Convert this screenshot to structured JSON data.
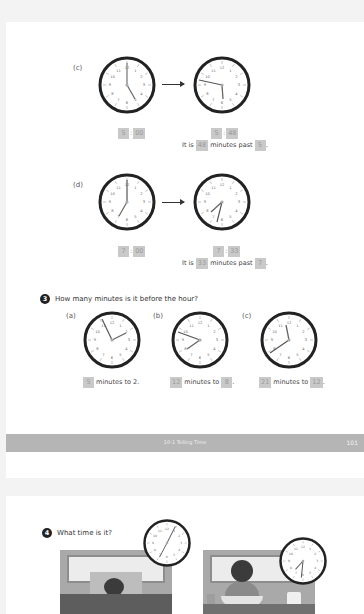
{
  "page1": {
    "part_c": {
      "label": "(c)",
      "start_time": {
        "hour": "5",
        "minute": "00"
      },
      "end_time": {
        "hour": "5",
        "minute": "48"
      },
      "sentence": {
        "prefix": "It is",
        "minutes": "48",
        "middle": "minutes past",
        "hour": "5",
        "suffix": "."
      }
    },
    "part_d": {
      "label": "(d)",
      "start_time": {
        "hour": "7",
        "minute": "00"
      },
      "end_time": {
        "hour": "7",
        "minute": "33"
      },
      "sentence": {
        "prefix": "It is",
        "minutes": "33",
        "middle": "minutes past",
        "hour": "7",
        "suffix": "."
      }
    },
    "question3": {
      "number": "3",
      "text": "How many minutes is it before the hour?",
      "items": [
        {
          "label": "(a)",
          "minutes": "5",
          "text": "minutes to 2."
        },
        {
          "label": "(b)",
          "minutes": "12",
          "text": "minutes to",
          "hour": "8",
          "suffix": "."
        },
        {
          "label": "(c)",
          "minutes": "21",
          "text": "minutes to",
          "hour": "12",
          "suffix": "."
        }
      ]
    },
    "footer": {
      "section": "10-1  Telling Time",
      "page_number": "101"
    }
  },
  "page2": {
    "question4": {
      "number": "4",
      "text": "What time is it?"
    }
  },
  "colors": {
    "answer_box": "#c9c9c9",
    "footer_bar": "#b5b5b5",
    "clock_rim": "#222222"
  }
}
